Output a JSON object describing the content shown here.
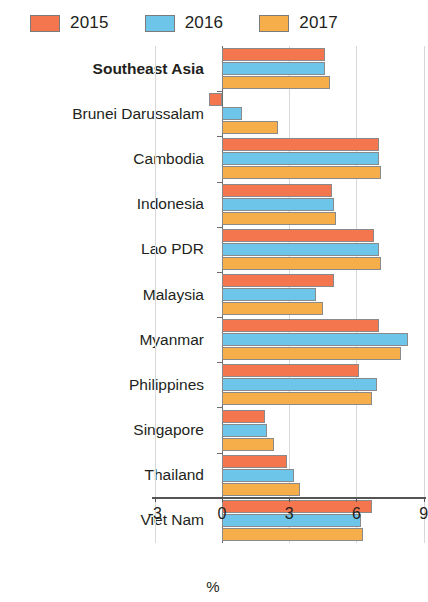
{
  "legend": {
    "position": "top-left",
    "items": [
      {
        "label": "2015",
        "color": "#F4764E"
      },
      {
        "label": "2016",
        "color": "#6DC5EA"
      },
      {
        "label": "2017",
        "color": "#F5AE4A"
      }
    ]
  },
  "axis": {
    "x_title": "%",
    "x_ticks": [
      "-3",
      "0",
      "3",
      "6",
      "9"
    ]
  },
  "chart_data": {
    "type": "bar",
    "orientation": "horizontal",
    "title": "",
    "subtitle": "",
    "xlabel": "%",
    "ylabel": "",
    "xlim": [
      -3,
      9
    ],
    "xticks": [
      -3,
      0,
      3,
      6,
      9
    ],
    "grid": true,
    "grid_axis": "x",
    "legend_position": "top-left",
    "categories": [
      "Southeast Asia",
      "Brunei Darussalam",
      "Cambodia",
      "Indonesia",
      "Lao PDR",
      "Malaysia",
      "Myanmar",
      "Philippines",
      "Singapore",
      "Thailand",
      "Viet Nam"
    ],
    "emphasized_categories": [
      "Southeast Asia"
    ],
    "series": [
      {
        "name": "2015",
        "color": "#F4764E",
        "values": [
          4.6,
          -0.6,
          7.0,
          4.9,
          6.8,
          5.0,
          7.0,
          6.1,
          1.9,
          2.9,
          6.7
        ]
      },
      {
        "name": "2016",
        "color": "#6DC5EA",
        "values": [
          4.6,
          0.9,
          7.0,
          5.0,
          7.0,
          4.2,
          8.3,
          6.9,
          2.0,
          3.2,
          6.2
        ]
      },
      {
        "name": "2017",
        "color": "#F5AE4A",
        "values": [
          4.8,
          2.5,
          7.1,
          5.1,
          7.1,
          4.5,
          8.0,
          6.7,
          2.3,
          3.5,
          6.3
        ]
      }
    ]
  }
}
